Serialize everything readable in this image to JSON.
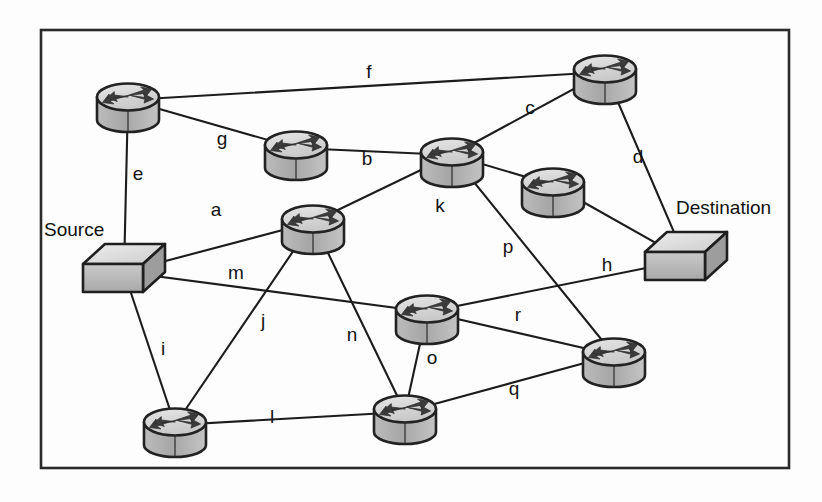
{
  "diagram": {
    "type": "network-topology",
    "border": {
      "x": 41,
      "y": 30,
      "width": 748,
      "height": 438,
      "color": "#2b2b2b"
    },
    "colors": {
      "line": "#1c1c1c",
      "router_top": "#d8d8d8",
      "router_body": "#a9a9a9",
      "router_outline": "#262626",
      "router_arrow": "#3a3a3a",
      "host_top": "#e2e2e2",
      "host_front": "#b4b4b4",
      "host_side": "#9a9a9a",
      "host_outline": "#232323",
      "text": "#101010",
      "background": "#fdfdfd"
    },
    "endpoints": [
      {
        "id": "source",
        "label": "Source",
        "shape": "host-box",
        "x": 124,
        "y": 272,
        "label_x": 44,
        "label_y": 236
      },
      {
        "id": "destination",
        "label": "Destination",
        "shape": "host-box",
        "x": 686,
        "y": 260,
        "label_x": 676,
        "label_y": 214
      }
    ],
    "routers": [
      {
        "id": "r1",
        "x": 128,
        "y": 100
      },
      {
        "id": "r2",
        "x": 296,
        "y": 148
      },
      {
        "id": "r3",
        "x": 452,
        "y": 155
      },
      {
        "id": "r4",
        "x": 605,
        "y": 72
      },
      {
        "id": "r5",
        "x": 313,
        "y": 222
      },
      {
        "id": "r6",
        "x": 553,
        "y": 185
      },
      {
        "id": "r7",
        "x": 427,
        "y": 312
      },
      {
        "id": "r8",
        "x": 614,
        "y": 355
      },
      {
        "id": "r9",
        "x": 405,
        "y": 412
      },
      {
        "id": "r10",
        "x": 175,
        "y": 425
      }
    ],
    "links": [
      {
        "id": "a",
        "label": "a",
        "from": "source",
        "to": "r5",
        "label_x": 216,
        "label_y": 216
      },
      {
        "id": "b",
        "label": "b",
        "from": "r2",
        "to": "r3",
        "label_x": 367,
        "label_y": 165
      },
      {
        "id": "c",
        "label": "c",
        "from": "r3",
        "to": "r4",
        "label_x": 530,
        "label_y": 114
      },
      {
        "id": "d",
        "label": "d",
        "from": "r4",
        "to": "destination",
        "label_x": 638,
        "label_y": 163
      },
      {
        "id": "e",
        "label": "e",
        "from": "r1",
        "to": "source",
        "label_x": 138,
        "label_y": 180
      },
      {
        "id": "f",
        "label": "f",
        "from": "r1",
        "to": "r4",
        "label_x": 369,
        "label_y": 78
      },
      {
        "id": "g",
        "label": "g",
        "from": "r1",
        "to": "r2",
        "label_x": 222,
        "label_y": 145
      },
      {
        "id": "h",
        "label": "h",
        "from": "r7",
        "to": "destination",
        "label_x": 607,
        "label_y": 271
      },
      {
        "id": "i",
        "label": "i",
        "from": "source",
        "to": "r10",
        "label_x": 163,
        "label_y": 355
      },
      {
        "id": "j",
        "label": "j",
        "from": "r5",
        "to": "r10",
        "label_x": 263,
        "label_y": 327
      },
      {
        "id": "k",
        "label": "k",
        "from": "r5",
        "to": "r3",
        "label_x": 440,
        "label_y": 212
      },
      {
        "id": "l",
        "label": "l",
        "from": "r10",
        "to": "r9",
        "label_x": 272,
        "label_y": 423
      },
      {
        "id": "m",
        "label": "m",
        "from": "source",
        "to": "r7",
        "label_x": 236,
        "label_y": 279
      },
      {
        "id": "n",
        "label": "n",
        "from": "r5",
        "to": "r9",
        "label_x": 352,
        "label_y": 341
      },
      {
        "id": "o",
        "label": "o",
        "from": "r7",
        "to": "r9",
        "label_x": 432,
        "label_y": 364
      },
      {
        "id": "p",
        "label": "p",
        "from": "r3",
        "to": "r8",
        "label_x": 508,
        "label_y": 253
      },
      {
        "id": "q",
        "label": "q",
        "from": "r9",
        "to": "r8",
        "label_x": 514,
        "label_y": 395
      },
      {
        "id": "r",
        "label": "r",
        "from": "r7",
        "to": "r8",
        "label_x": 518,
        "label_y": 321
      },
      {
        "id": "r3_r6",
        "label": "",
        "from": "r3",
        "to": "r6",
        "label_x": 0,
        "label_y": 0
      },
      {
        "id": "r6_dest",
        "label": "",
        "from": "r6",
        "to": "destination",
        "label_x": 0,
        "label_y": 0
      }
    ]
  }
}
